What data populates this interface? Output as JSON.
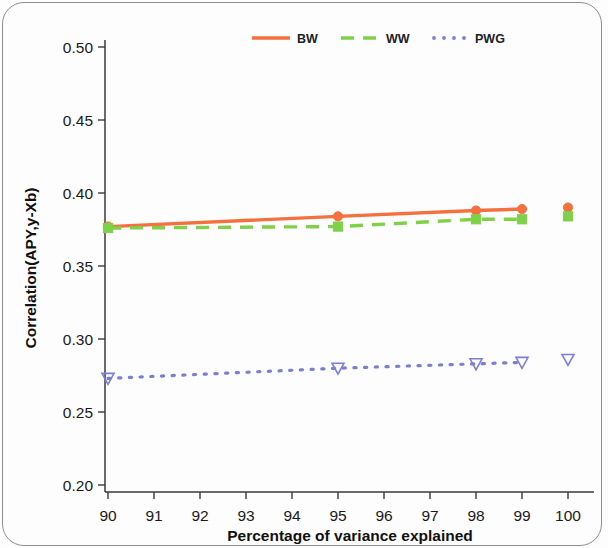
{
  "chart_data": {
    "type": "line",
    "title": "",
    "subtitle": "",
    "xlabel": "Percentage of variance explained",
    "ylabel": "Correlation(APY,y-Xb)",
    "xlim": [
      89.6,
      100.6
    ],
    "ylim": [
      0.195,
      0.515
    ],
    "xticks": [
      90,
      91,
      92,
      93,
      94,
      95,
      96,
      97,
      98,
      99,
      100
    ],
    "xtick_labels": [
      "90",
      "91",
      "92",
      "93",
      "94",
      "95",
      "96",
      "97",
      "98",
      "99",
      "100"
    ],
    "yticks": [
      0.2,
      0.25,
      0.3,
      0.35,
      0.4,
      0.45,
      0.5
    ],
    "ytick_labels": [
      "0.20",
      "0.25",
      "0.30",
      "0.35",
      "0.40",
      "0.45",
      "0.50"
    ],
    "grid": false,
    "legend_position": "top-center",
    "x": [
      90,
      95,
      98,
      99,
      100
    ],
    "series": [
      {
        "name": "BW",
        "color": "#F4713F",
        "linestyle": "solid",
        "marker": "circle",
        "values": [
          0.377,
          0.384,
          0.388,
          0.389,
          0.39
        ],
        "connected_through": [
          90,
          95,
          98,
          99
        ],
        "isolated_points": [
          100
        ]
      },
      {
        "name": "WW",
        "color": "#7FD14A",
        "linestyle": "dashed",
        "marker": "square",
        "values": [
          0.376,
          0.377,
          0.382,
          0.382,
          0.384
        ],
        "connected_through": [
          90,
          95,
          98,
          99
        ],
        "isolated_points": [
          100
        ]
      },
      {
        "name": "PWG",
        "color": "#7B7FD4",
        "linestyle": "dotted",
        "marker": "triangle-down",
        "values": [
          0.273,
          0.28,
          0.283,
          0.284,
          0.286
        ],
        "connected_through": [
          90,
          95,
          98,
          99
        ],
        "isolated_points": [
          100
        ]
      }
    ]
  },
  "legend": {
    "entries": [
      {
        "label": "BW"
      },
      {
        "label": "WW"
      },
      {
        "label": "PWG"
      }
    ]
  }
}
